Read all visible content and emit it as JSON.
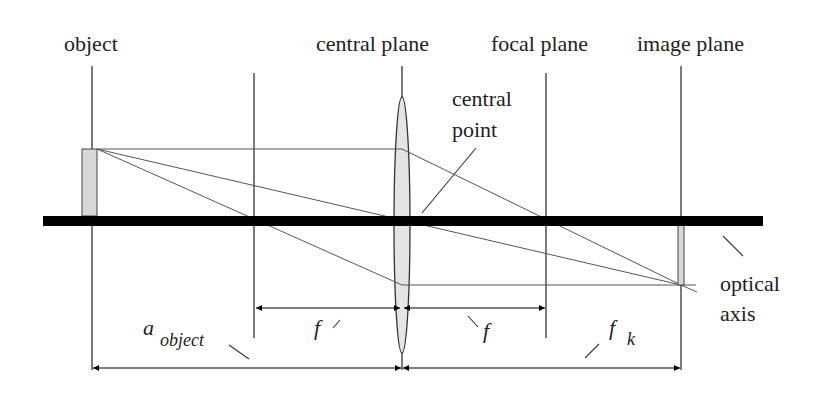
{
  "labels": {
    "object": "object",
    "central_plane": "central plane",
    "focal_plane": "focal plane",
    "image_plane": "image plane",
    "central_point_line1": "central",
    "central_point_line2": "point",
    "optical_axis_line1": "optical",
    "optical_axis_line2": "axis"
  },
  "dimensions": {
    "f_left": "f",
    "f_right": "f",
    "a_object_main": "a",
    "a_object_sub": "object",
    "f_k_main": "f",
    "f_k_sub": "k"
  },
  "colors": {
    "line": "#333333",
    "axis": "#000000",
    "lens_fill": "#e4e4e4",
    "object_fill": "#d8d8d8"
  }
}
